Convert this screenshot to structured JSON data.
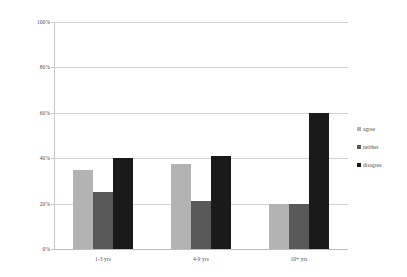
{
  "chart_data": {
    "type": "bar",
    "title": "",
    "subtitle": "",
    "xlabel": "",
    "ylabel": "",
    "categories": [
      "1-3 yrs",
      "4-9 yrs",
      "10+ yrs"
    ],
    "series": [
      {
        "name": "agree",
        "color": "#b3b3b3",
        "values": [
          35,
          37.5,
          20
        ]
      },
      {
        "name": "neither",
        "color": "#595959",
        "values": [
          25,
          21,
          20
        ]
      },
      {
        "name": "disagree",
        "color": "#1a1a1a",
        "values": [
          40,
          41,
          60
        ]
      }
    ],
    "ylim": [
      0,
      100
    ],
    "ytick_values": [
      0,
      20,
      40,
      60,
      80,
      100
    ],
    "ytick_labels": [
      "0%",
      "20%",
      "40%",
      "60%",
      "80%",
      "100%"
    ],
    "grid": true,
    "grid_axis": "y",
    "legend_position": "right",
    "grouping": "clustered",
    "value_unit": "%"
  },
  "axes": {
    "y": {
      "ticks": [
        {
          "label": "100%",
          "value": 100
        },
        {
          "label": "80%",
          "value": 80
        },
        {
          "label": "60%",
          "value": 60
        },
        {
          "label": "40%",
          "value": 40
        },
        {
          "label": "20%",
          "value": 20
        },
        {
          "label": "0%",
          "value": 0
        }
      ]
    },
    "x": {
      "ticks": [
        {
          "label": "1-3 yrs"
        },
        {
          "label": "4-9 yrs"
        },
        {
          "label": "10+ yrs"
        }
      ]
    }
  },
  "legend": {
    "items": [
      {
        "label": "agree",
        "color": "#b3b3b3"
      },
      {
        "label": "neither",
        "color": "#595959"
      },
      {
        "label": "disagree",
        "color": "#1a1a1a"
      }
    ]
  },
  "colors": {
    "background": "#ffffff",
    "gridline": "#d2d2d2",
    "axis": "#c0c0c0",
    "text": "#4a4a4a"
  }
}
